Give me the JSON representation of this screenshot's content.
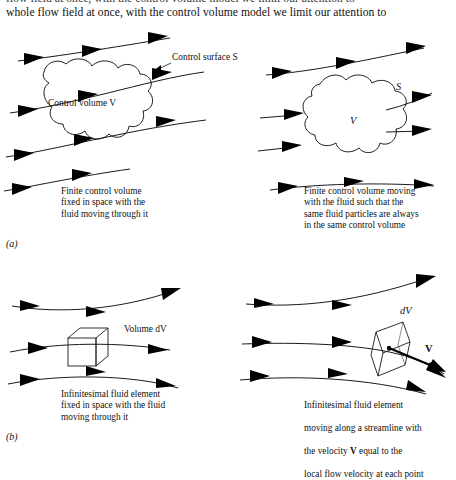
{
  "document": {
    "body_text_cut_line": "flow field at once, with the control volume model we limit our attention to",
    "body_text_line": "whole flow field at once, with the control volume model we limit our attention to"
  },
  "figure": {
    "subfigure_labels": {
      "a": "(a)",
      "b": "(b)"
    },
    "panels": [
      {
        "id": "top-left",
        "labels": {
          "control_surface": "Control surface S",
          "control_volume": "Control volume V"
        },
        "caption": "Finite control volume\nfixed in space with the\nfluid moving through it"
      },
      {
        "id": "top-right",
        "labels": {
          "surface": "S",
          "volume": "V"
        },
        "caption": "Finite control volume moving\nwith the fluid such that the\nsame fluid particles are always\nin the same control volume"
      },
      {
        "id": "bottom-left",
        "labels": {
          "volume_dv": "Volume dV"
        },
        "caption": "Infinitesimal fluid element\nfixed in space with the fluid\nmoving through it"
      },
      {
        "id": "bottom-right",
        "labels": {
          "dv": "dV",
          "velocity": "V"
        },
        "caption_parts": {
          "line1": "Infinitesimal fluid element",
          "line2": "moving along a streamline with",
          "line3_pre": "the velocity ",
          "line3_bold": "V",
          "line3_post": " equal to the",
          "line4": "local flow velocity at each point"
        }
      }
    ]
  },
  "colors": {
    "background": "#ffffff",
    "ink": "#1a1a1a",
    "text": "#111111"
  }
}
